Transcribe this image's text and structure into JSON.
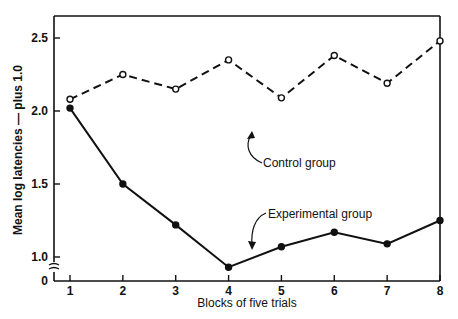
{
  "chart_data": {
    "type": "line",
    "title": "",
    "xlabel": "Blocks of five trials",
    "ylabel": "Mean log latencies — plus 1.0",
    "x": [
      1,
      2,
      3,
      4,
      5,
      6,
      7,
      8
    ],
    "x_tick_labels": [
      "1",
      "2",
      "3",
      "4",
      "5",
      "6",
      "7",
      "8"
    ],
    "y_tick_labels": [
      "0",
      "1.0",
      "1.5",
      "2.0",
      "2.5"
    ],
    "y_ticks": [
      1.0,
      1.5,
      2.0,
      2.5
    ],
    "ylim": [
      0.85,
      2.65
    ],
    "axis_break": "y-axis broken between 0 and 1.0",
    "grid": false,
    "legend": "none (series labeled by inline annotations with arrows)",
    "series": [
      {
        "name": "Control group",
        "style": "dashed line, open circle markers",
        "values": [
          2.08,
          2.25,
          2.15,
          2.35,
          2.09,
          2.38,
          2.19,
          2.48
        ]
      },
      {
        "name": "Experimental group",
        "style": "solid line, filled circle markers",
        "values": [
          2.02,
          1.5,
          1.22,
          0.93,
          1.07,
          1.17,
          1.09,
          1.25
        ]
      }
    ],
    "annotations": [
      {
        "text": "Control group",
        "points_to": "control line between blocks 4 and 5"
      },
      {
        "text": "Experimental group",
        "points_to": "experimental line between blocks 4 and 5"
      }
    ]
  }
}
